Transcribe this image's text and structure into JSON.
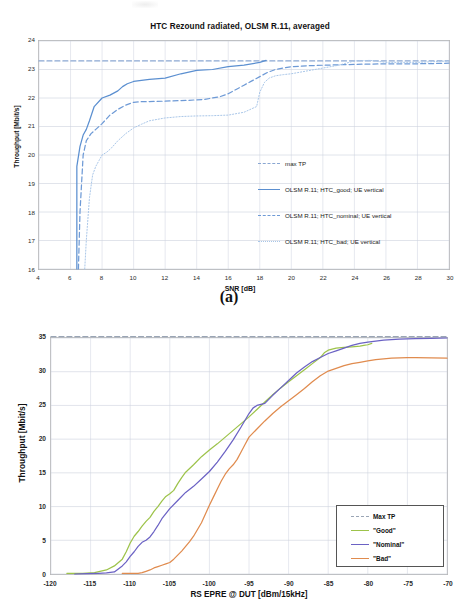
{
  "figure": {
    "panel_a_label": "(a)"
  },
  "chart_data": [
    {
      "id": "chart-a",
      "type": "line",
      "title": "HTC Rezound radiated, OLSM R.11, averaged",
      "xlabel": "SNR [dB]",
      "ylabel": "Throughput [Mbit/s]",
      "xlim": [
        4,
        30
      ],
      "ylim": [
        16,
        24
      ],
      "xticks": [
        "4",
        "6",
        "8",
        "10",
        "12",
        "14",
        "16",
        "18",
        "20",
        "22",
        "24",
        "26",
        "28",
        "30"
      ],
      "yticks": [
        "16",
        "17",
        "18",
        "19",
        "20",
        "21",
        "22",
        "23",
        "24"
      ],
      "grid": true,
      "legend_position": "inside-right",
      "series": [
        {
          "name": "max TP",
          "style": "dashed",
          "color": "#8aa7d2",
          "constant_value": 23.3,
          "x": [
            4,
            30
          ],
          "y": [
            23.3,
            23.3
          ]
        },
        {
          "name": "OLSM R.11; HTC_good; UE vertical",
          "style": "solid",
          "color": "#5b8fd0",
          "x": [
            6.4,
            6.4,
            6.6,
            6.8,
            7.0,
            7.2,
            7.5,
            8.0,
            8.5,
            9.0,
            9.3,
            9.6,
            10.0,
            11.0,
            12.0,
            13.0,
            14.0,
            15.0,
            16.0,
            17.0,
            18.0,
            18.4
          ],
          "y": [
            16.0,
            19.6,
            20.3,
            20.7,
            20.9,
            21.2,
            21.7,
            22.0,
            22.1,
            22.25,
            22.4,
            22.5,
            22.58,
            22.65,
            22.7,
            22.85,
            22.97,
            23.0,
            23.1,
            23.15,
            23.25,
            23.32
          ]
        },
        {
          "name": "OLSM R.11; HTC_nominal; UE vertical",
          "style": "dashed",
          "color": "#6e9ad6",
          "x": [
            6.5,
            6.6,
            6.8,
            7.0,
            7.3,
            7.6,
            8.0,
            8.5,
            9.0,
            9.5,
            10.0,
            10.5,
            11.5,
            12.5,
            13.5,
            14.5,
            15.5,
            16.0,
            16.5,
            17.0,
            17.5,
            18.0,
            18.5,
            19.0,
            20.0,
            21.0,
            22.0,
            24.0,
            26.0,
            28.0,
            30.0
          ],
          "y": [
            16.0,
            18.0,
            20.0,
            20.5,
            20.75,
            20.9,
            21.1,
            21.4,
            21.6,
            21.75,
            21.85,
            21.87,
            21.88,
            21.9,
            21.92,
            21.95,
            22.05,
            22.15,
            22.3,
            22.45,
            22.6,
            22.75,
            22.9,
            23.0,
            23.1,
            23.13,
            23.15,
            23.18,
            23.2,
            23.2,
            23.22
          ]
        },
        {
          "name": "OLSM R.11; HTC_bad; UE vertical",
          "style": "dotted",
          "color": "#a8c6e8",
          "x": [
            6.9,
            7.0,
            7.2,
            7.4,
            7.6,
            7.8,
            8.0,
            8.3,
            8.6,
            9.0,
            9.5,
            10.0,
            10.5,
            11.0,
            11.5,
            12.0,
            13.0,
            14.0,
            15.0,
            16.0,
            17.0,
            17.8,
            18.0,
            18.3,
            18.6,
            19.0,
            19.5,
            20.0,
            21.0,
            22.0,
            23.0,
            24.0,
            25.0,
            26.0,
            28.0,
            30.0
          ],
          "y": [
            16.0,
            17.0,
            18.5,
            19.3,
            19.6,
            19.8,
            20.0,
            20.1,
            20.25,
            20.5,
            20.75,
            20.95,
            21.08,
            21.2,
            21.25,
            21.3,
            21.35,
            21.37,
            21.38,
            21.4,
            21.5,
            21.7,
            22.2,
            22.55,
            22.7,
            22.78,
            22.82,
            22.85,
            22.95,
            23.05,
            23.15,
            23.3,
            23.32,
            23.25,
            23.25,
            23.3
          ]
        }
      ]
    },
    {
      "id": "chart-b",
      "type": "line",
      "title": "",
      "xlabel": "RS EPRE @ DUT [dBm/15kHz]",
      "ylabel": "Throughput [Mbit/s]",
      "xlim": [
        -120,
        -70
      ],
      "ylim": [
        0,
        35
      ],
      "xticks": [
        "-120",
        "-115",
        "-110",
        "-105",
        "-100",
        "-95",
        "-90",
        "-85",
        "-80",
        "-75",
        "-70"
      ],
      "yticks": [
        "0",
        "5",
        "10",
        "15",
        "20",
        "25",
        "30",
        "35"
      ],
      "grid": true,
      "legend_position": "inside-bottom-right",
      "series": [
        {
          "name": "Max TP",
          "style": "dashed",
          "color": "#9aa5b5",
          "constant_value": 35.2,
          "x": [
            -120,
            -70
          ],
          "y": [
            35.2,
            35.2
          ]
        },
        {
          "name": "\"Good\"",
          "style": "solid",
          "color": "#9dc34a",
          "x": [
            -118,
            -116,
            -114.5,
            -113,
            -112,
            -111,
            -110.5,
            -110,
            -109.5,
            -109,
            -108.5,
            -108,
            -107.5,
            -107,
            -106.5,
            -106,
            -105.5,
            -105,
            -104.5,
            -104,
            -103.5,
            -103,
            -102,
            -101,
            -100,
            -99,
            -98,
            -97,
            -96,
            -95,
            -94,
            -93,
            -92,
            -91,
            -90,
            -89,
            -88,
            -87,
            -86,
            -85.5,
            -85,
            -84,
            -83,
            -82,
            -81,
            -80.5,
            -80,
            -79.5
          ],
          "y": [
            0.1,
            0.1,
            0.2,
            0.6,
            1.2,
            2.2,
            3.3,
            4.6,
            5.6,
            6.3,
            7.1,
            7.8,
            8.4,
            9.3,
            10.0,
            10.8,
            11.5,
            11.9,
            12.4,
            13.4,
            14.3,
            15.1,
            16.2,
            17.4,
            18.4,
            19.3,
            20.3,
            21.3,
            22.3,
            23.3,
            24.4,
            25.5,
            26.6,
            27.6,
            28.5,
            29.4,
            30.3,
            31.2,
            32.1,
            32.8,
            33.2,
            33.5,
            33.6,
            33.7,
            33.8,
            33.9,
            34.0,
            34.2
          ]
        },
        {
          "name": "\"Nominal\"",
          "style": "solid",
          "color": "#6b62c4",
          "x": [
            -117,
            -115.5,
            -114,
            -113,
            -112,
            -111,
            -110.5,
            -110,
            -109.5,
            -109,
            -108.5,
            -108,
            -107.5,
            -107,
            -106.5,
            -106,
            -105,
            -104,
            -103,
            -102,
            -101,
            -100,
            -99,
            -98,
            -97,
            -96,
            -95.5,
            -95,
            -94.5,
            -94,
            -93,
            -92,
            -91,
            -90,
            -89,
            -88,
            -87,
            -86,
            -85,
            -84,
            -83,
            -82,
            -81,
            -80,
            -78,
            -76,
            -74,
            -72,
            -70
          ],
          "y": [
            0.0,
            0.05,
            0.1,
            0.15,
            0.3,
            1.2,
            1.8,
            2.6,
            3.3,
            4.1,
            4.7,
            5.0,
            5.5,
            6.3,
            7.2,
            8.2,
            9.7,
            10.9,
            12.1,
            13.0,
            14.1,
            15.2,
            16.6,
            18.2,
            19.9,
            21.8,
            22.8,
            23.8,
            24.6,
            25.0,
            25.3,
            26.5,
            27.6,
            28.7,
            29.8,
            30.7,
            31.5,
            32.1,
            32.7,
            33.1,
            33.5,
            33.9,
            34.2,
            34.4,
            34.7,
            34.85,
            34.9,
            34.95,
            35.0
          ]
        },
        {
          "name": "\"Bad\"",
          "style": "solid",
          "color": "#e08b4e",
          "x": [
            -111,
            -110,
            -109,
            -108.5,
            -108,
            -107.5,
            -107,
            -106.5,
            -106,
            -105.5,
            -105,
            -104.5,
            -104,
            -103.5,
            -103,
            -102.5,
            -102,
            -101.5,
            -101,
            -100.5,
            -100,
            -99.5,
            -99,
            -98.5,
            -98,
            -97.5,
            -97,
            -96.5,
            -96,
            -95.5,
            -95,
            -94,
            -93,
            -92,
            -91,
            -90,
            -89,
            -88,
            -87,
            -86,
            -85,
            -84,
            -83,
            -82,
            -81,
            -80,
            -79,
            -78,
            -77,
            -76,
            -75,
            -74,
            -72,
            -70
          ],
          "y": [
            0.08,
            0.08,
            0.1,
            0.2,
            0.4,
            0.6,
            0.9,
            1.1,
            1.3,
            1.5,
            1.7,
            2.2,
            2.8,
            3.4,
            4.1,
            4.8,
            5.6,
            6.6,
            7.6,
            8.9,
            10.2,
            11.4,
            12.6,
            13.8,
            14.8,
            15.6,
            16.2,
            17.0,
            18.1,
            19.2,
            20.3,
            21.5,
            22.7,
            23.8,
            24.8,
            25.7,
            26.6,
            27.5,
            28.5,
            29.4,
            30.1,
            30.5,
            30.9,
            31.2,
            31.4,
            31.6,
            31.8,
            31.9,
            32.0,
            32.05,
            32.1,
            32.1,
            32.05,
            32.0
          ]
        }
      ]
    }
  ],
  "legends": {
    "chart_a": [
      {
        "label": "max TP",
        "style": "dashed",
        "color": "#8aa7d2"
      },
      {
        "label": "OLSM R.11; HTC_good; UE vertical",
        "style": "solid",
        "color": "#5b8fd0"
      },
      {
        "label": "OLSM R.11; HTC_nominal; UE vertical",
        "style": "dashed",
        "color": "#6e9ad6"
      },
      {
        "label": "OLSM R.11; HTC_bad; UE vertical",
        "style": "dotted",
        "color": "#a8c6e8"
      }
    ],
    "chart_b": [
      {
        "label": "Max TP",
        "style": "dashed",
        "color": "#9aa5b5"
      },
      {
        "label": "\"Good\"",
        "style": "solid",
        "color": "#9dc34a"
      },
      {
        "label": "\"Nominal\"",
        "style": "solid",
        "color": "#6b62c4"
      },
      {
        "label": "\"Bad\"",
        "style": "solid",
        "color": "#e08b4e"
      }
    ]
  }
}
